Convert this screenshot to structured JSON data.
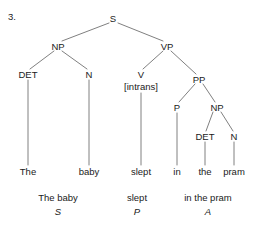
{
  "figure": {
    "item_number": "3.",
    "sentence": "The baby slept in the pram",
    "background_color": "#ffffff",
    "line_color": "#808080",
    "text_color": "#1a1a1a"
  },
  "nodes": [
    {
      "id": "s",
      "label": "S",
      "x": 113,
      "y": 18,
      "kind": "node"
    },
    {
      "id": "np1",
      "label": "NP",
      "x": 58,
      "y": 46,
      "kind": "node"
    },
    {
      "id": "vp",
      "label": "VP",
      "x": 167,
      "y": 46,
      "kind": "node"
    },
    {
      "id": "det1",
      "label": "DET",
      "x": 28,
      "y": 74,
      "kind": "node"
    },
    {
      "id": "n1",
      "label": "N",
      "x": 89,
      "y": 74,
      "kind": "node"
    },
    {
      "id": "v",
      "label": "V",
      "x": 141,
      "y": 74,
      "kind": "node"
    },
    {
      "id": "vfeat",
      "label": "[intrans]",
      "x": 141,
      "y": 86,
      "kind": "feature"
    },
    {
      "id": "pp",
      "label": "PP",
      "x": 199,
      "y": 79,
      "kind": "node"
    },
    {
      "id": "p",
      "label": "P",
      "x": 177,
      "y": 107,
      "kind": "node"
    },
    {
      "id": "np2",
      "label": "NP",
      "x": 217,
      "y": 107,
      "kind": "node"
    },
    {
      "id": "det2",
      "label": "DET",
      "x": 205,
      "y": 136,
      "kind": "node"
    },
    {
      "id": "n2",
      "label": "N",
      "x": 234,
      "y": 136,
      "kind": "node"
    }
  ],
  "terminals": [
    {
      "id": "w-the1",
      "label": "The",
      "x": 28,
      "y": 171
    },
    {
      "id": "w-baby",
      "label": "baby",
      "x": 89,
      "y": 171
    },
    {
      "id": "w-slept",
      "label": "slept",
      "x": 141,
      "y": 171
    },
    {
      "id": "w-in",
      "label": "in",
      "x": 177,
      "y": 171
    },
    {
      "id": "w-the2",
      "label": "the",
      "x": 205,
      "y": 171
    },
    {
      "id": "w-pram",
      "label": "pram",
      "x": 234,
      "y": 171
    }
  ],
  "branches": [
    {
      "from": "s",
      "to": "np1",
      "x1": 109,
      "y1": 23,
      "x2": 62,
      "y2": 41
    },
    {
      "from": "s",
      "to": "vp",
      "x1": 118,
      "y1": 23,
      "x2": 163,
      "y2": 41
    },
    {
      "from": "np1",
      "to": "det1",
      "x1": 54,
      "y1": 51,
      "x2": 30,
      "y2": 69
    },
    {
      "from": "np1",
      "to": "n1",
      "x1": 62,
      "y1": 51,
      "x2": 87,
      "y2": 69
    },
    {
      "from": "vp",
      "to": "v",
      "x1": 163,
      "y1": 51,
      "x2": 143,
      "y2": 69
    },
    {
      "from": "vp",
      "to": "pp",
      "x1": 171,
      "y1": 51,
      "x2": 196,
      "y2": 74
    },
    {
      "from": "pp",
      "to": "p",
      "x1": 195,
      "y1": 84,
      "x2": 179,
      "y2": 102
    },
    {
      "from": "pp",
      "to": "np2",
      "x1": 203,
      "y1": 84,
      "x2": 215,
      "y2": 102
    },
    {
      "from": "np2",
      "to": "det2",
      "x1": 213,
      "y1": 112,
      "x2": 206,
      "y2": 131
    },
    {
      "from": "np2",
      "to": "n2",
      "x1": 221,
      "y1": 112,
      "x2": 233,
      "y2": 131
    }
  ],
  "stems": [
    {
      "from": "det1",
      "to": "w-the1",
      "x": 28,
      "y1": 80,
      "y2": 165
    },
    {
      "from": "n1",
      "to": "w-baby",
      "x": 89,
      "y1": 80,
      "y2": 165
    },
    {
      "from": "v",
      "to": "w-slept",
      "x": 141,
      "y1": 93,
      "y2": 165
    },
    {
      "from": "p",
      "to": "w-in",
      "x": 177,
      "y1": 113,
      "y2": 165
    },
    {
      "from": "det2",
      "to": "w-the2",
      "x": 205,
      "y1": 142,
      "y2": 165
    },
    {
      "from": "n2",
      "to": "w-pram",
      "x": 234,
      "y1": 142,
      "y2": 165
    }
  ],
  "functions": [
    {
      "id": "func-s",
      "phrase": "The  baby",
      "symbol": "S",
      "x": 58,
      "phrase_y": 197,
      "symbol_y": 211
    },
    {
      "id": "func-p",
      "phrase": "slept",
      "symbol": "P",
      "x": 137,
      "phrase_y": 197,
      "symbol_y": 211
    },
    {
      "id": "func-a",
      "phrase": "in the pram",
      "symbol": "A",
      "x": 208,
      "phrase_y": 197,
      "symbol_y": 211
    }
  ]
}
